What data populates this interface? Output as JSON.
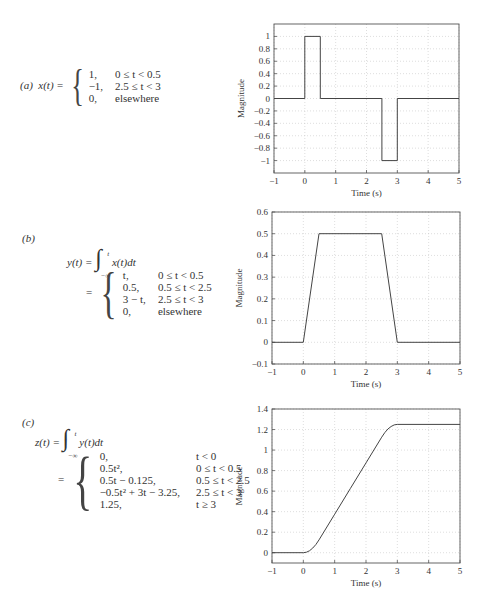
{
  "panels": [
    {
      "label": "(a)",
      "lhs": "x(t) =",
      "cases": [
        {
          "value": "1,",
          "cond": "0 ≤ t < 0.5"
        },
        {
          "value": "−1,",
          "cond": "2.5 ≤ t < 3"
        },
        {
          "value": "0,",
          "cond": "elsewhere"
        }
      ]
    },
    {
      "label": "(b)",
      "lhs": "y(t) =",
      "integrand": "x(t)dt",
      "upper": "t",
      "lower": "−∞",
      "eq2": "=",
      "cases": [
        {
          "value": "t,",
          "cond": "0 ≤ t < 0.5"
        },
        {
          "value": "0.5,",
          "cond": "0.5 ≤ t < 2.5"
        },
        {
          "value": "3 − t,",
          "cond": "2.5 ≤ t < 3"
        },
        {
          "value": "0,",
          "cond": "elsewhere"
        }
      ]
    },
    {
      "label": "(c)",
      "lhs": "z(t) =",
      "integrand": "y(t)dt",
      "upper": "t",
      "lower": "−∞",
      "eq2": "=",
      "cases": [
        {
          "value": "0,",
          "cond": "t < 0"
        },
        {
          "value": "0.5t²,",
          "cond": "0 ≤ t < 0.5"
        },
        {
          "value": "0.5t − 0.125,",
          "cond": "0.5 ≤ t < 2.5"
        },
        {
          "value": "−0.5t² + 3t − 3.25,",
          "cond": "2.5 ≤ t < 3"
        },
        {
          "value": "1.25,",
          "cond": "t ≥ 3"
        }
      ]
    }
  ],
  "chart_data": [
    {
      "type": "line",
      "title": "",
      "xlabel": "Time (s)",
      "ylabel": "Magnitude",
      "xlim": [
        -1,
        5
      ],
      "ylim": [
        -1.2,
        1.2
      ],
      "xticks": [
        -1,
        0,
        1,
        2,
        3,
        4,
        5
      ],
      "yticks": [
        -1,
        -0.8,
        -0.6,
        -0.4,
        -0.2,
        0,
        0.2,
        0.4,
        0.6,
        0.8,
        1
      ],
      "ytick_labels": [
        "−1",
        "−0.8",
        "−0.6",
        "−0.4",
        "−0.2",
        "0",
        "0.2",
        "0.4",
        "0.6",
        "0.8",
        "1"
      ],
      "xtick_labels": [
        "−1",
        "0",
        "1",
        "2",
        "3",
        "4",
        "5"
      ],
      "grid": true,
      "series": [
        {
          "name": "x(t)",
          "x": [
            -1,
            0,
            0,
            0.5,
            0.5,
            2.5,
            2.5,
            3,
            3,
            5
          ],
          "y": [
            0,
            0,
            1,
            1,
            0,
            0,
            -1,
            -1,
            0,
            0
          ]
        }
      ],
      "frame": {
        "top": 24,
        "height": 149,
        "left": 44,
        "width": 185
      }
    },
    {
      "type": "line",
      "title": "",
      "xlabel": "Time (s)",
      "ylabel": "Magnitude",
      "xlim": [
        -1,
        5
      ],
      "ylim": [
        -0.1,
        0.6
      ],
      "xticks": [
        -1,
        0,
        1,
        2,
        3,
        4,
        5
      ],
      "yticks": [
        -0.1,
        0,
        0.1,
        0.2,
        0.3,
        0.4,
        0.5,
        0.6
      ],
      "ytick_labels": [
        "−0.1",
        "0",
        "0.1",
        "0.2",
        "0.3",
        "0.4",
        "0.5",
        "0.6"
      ],
      "xtick_labels": [
        "−1",
        "0",
        "1",
        "2",
        "3",
        "4",
        "5"
      ],
      "grid": true,
      "series": [
        {
          "name": "y(t)",
          "x": [
            -1,
            0,
            0.5,
            2.5,
            3,
            5
          ],
          "y": [
            0,
            0,
            0.5,
            0.5,
            0,
            0
          ]
        }
      ],
      "frame": {
        "top": 212,
        "height": 152,
        "left": 42,
        "width": 188
      }
    },
    {
      "type": "line",
      "title": "",
      "xlabel": "Time (s)",
      "ylabel": "Magnitude",
      "xlim": [
        -1,
        5
      ],
      "ylim": [
        -0.1,
        1.4
      ],
      "xticks": [
        -1,
        0,
        1,
        2,
        3,
        4,
        5
      ],
      "yticks": [
        0,
        0.2,
        0.4,
        0.6,
        0.8,
        1,
        1.2,
        1.4
      ],
      "ytick_labels": [
        "0",
        "0.2",
        "0.4",
        "0.6",
        "0.8",
        "1",
        "1.2",
        "1.4"
      ],
      "xtick_labels": [
        "−1",
        "0",
        "1",
        "2",
        "3",
        "4",
        "5"
      ],
      "grid": true,
      "series": [
        {
          "name": "z(t)",
          "x": [
            -1,
            0,
            0.1,
            0.2,
            0.3,
            0.4,
            0.5,
            1,
            1.5,
            2,
            2.5,
            2.6,
            2.7,
            2.8,
            2.9,
            3,
            5
          ],
          "y": [
            0,
            0,
            0.005,
            0.02,
            0.045,
            0.08,
            0.125,
            0.375,
            0.625,
            0.875,
            1.125,
            1.17,
            1.205,
            1.23,
            1.245,
            1.25,
            1.25
          ]
        }
      ],
      "frame": {
        "top": 409,
        "height": 154,
        "left": 42,
        "width": 188
      }
    }
  ]
}
